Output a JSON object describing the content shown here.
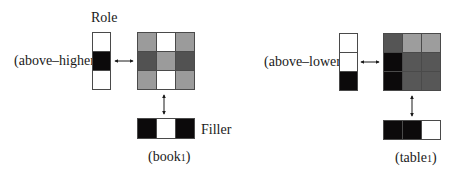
{
  "labels": {
    "role": "Role",
    "filler": "Filler",
    "left_role_name": "(above–higher)",
    "right_role_name": "(above–lower)",
    "left_filler_name": "(book",
    "left_filler_sub": "1",
    "left_filler_close": ")",
    "right_filler_name": "(table",
    "right_filler_sub": "1",
    "right_filler_close": ")"
  },
  "colors": {
    "white": "#ffffff",
    "black": "#0c0a0b",
    "light_gray": "#9a9a9a",
    "mid_gray": "#6e6e6e",
    "dark_gray": "#4f4f4f",
    "darker_gray": "#555555",
    "border": "#4a4a4a"
  },
  "left_example": {
    "role_vector": [
      "#ffffff",
      "#0c0a0b",
      "#ffffff"
    ],
    "matrix": [
      [
        "#9b9b9b",
        "#ffffff",
        "#9b9b9b"
      ],
      [
        "#525252",
        "#9b9b9b",
        "#525252"
      ],
      [
        "#9b9b9b",
        "#ffffff",
        "#9b9b9b"
      ]
    ],
    "filler_vector": [
      "#0c0a0b",
      "#ffffff",
      "#0c0a0b"
    ]
  },
  "right_example": {
    "role_vector": [
      "#ffffff",
      "#ffffff",
      "#0c0a0b"
    ],
    "matrix": [
      [
        "#555555",
        "#9d9d9d",
        "#9d9d9d"
      ],
      [
        "#0c0a0b",
        "#575757",
        "#575757"
      ],
      [
        "#0c0a0b",
        "#575757",
        "#575757"
      ]
    ],
    "filler_vector": [
      "#0c0a0b",
      "#0c0a0b",
      "#ffffff"
    ]
  }
}
